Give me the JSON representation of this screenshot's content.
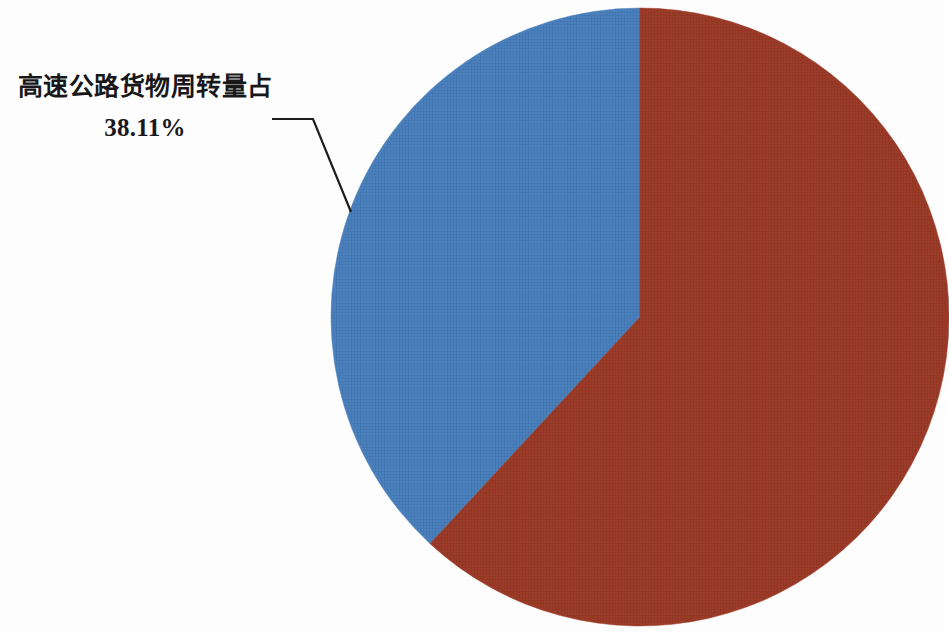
{
  "figure": {
    "background_color": "#ffffff",
    "width": 949,
    "height": 634
  },
  "callout": {
    "label": "高速公路货物周转量占",
    "value": "38.11%",
    "leader_line_color": "#1d1d20"
  },
  "chart_data": {
    "type": "pie",
    "title": "",
    "subtitle": "",
    "xlabel": "",
    "ylabel": "",
    "legend_position": "none",
    "grid": false,
    "center": [
      640,
      317
    ],
    "radius": 309,
    "start_angle_deg": 0,
    "direction": "counterclockwise",
    "labels": [
      "高速公路货物周转量占",
      "其他"
    ],
    "values": [
      38.11,
      61.89
    ],
    "percent_labels": [
      "38.11%",
      ""
    ],
    "colors": [
      "#4a80bd",
      "#9c3b28"
    ],
    "slices": [
      {
        "name": "高速公路货物周转量占",
        "percent": 38.11,
        "percent_label": "38.11%",
        "color": "#4a80bd",
        "labeled": true
      },
      {
        "name": "其他",
        "percent": 61.89,
        "percent_label": "",
        "color": "#9c3b28",
        "labeled": false
      }
    ]
  }
}
